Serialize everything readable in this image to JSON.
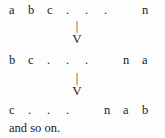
{
  "figure": {
    "background_color": "#fdfdfd",
    "text_color": "#1a1a1a",
    "rows": [
      {
        "id": "row-1",
        "tokens": [
          "a",
          "b",
          "c",
          ".",
          ".",
          ".",
          "",
          "n"
        ],
        "text": "a b c . . . n"
      },
      {
        "id": "row-2",
        "tokens": [
          "b",
          "c",
          ".",
          ".",
          ".",
          "",
          "n",
          "a"
        ],
        "text": "b c . . . n a"
      },
      {
        "id": "row-3",
        "tokens": [
          "c",
          ".",
          ".",
          ".",
          "",
          "n",
          "a",
          "b"
        ],
        "text": "c . . . n a b"
      }
    ],
    "arrows": [
      {
        "id": "arrow-1",
        "shaft": "|",
        "head": "V",
        "meaning": "maps-to-down"
      },
      {
        "id": "arrow-2",
        "shaft": "|",
        "head": "V",
        "meaning": "maps-to-down"
      }
    ],
    "caption": "and so on."
  }
}
